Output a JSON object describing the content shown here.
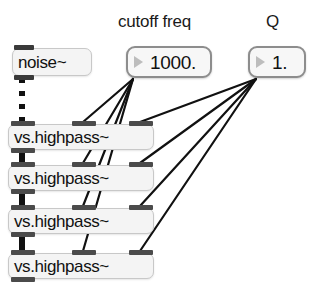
{
  "patch": {
    "title": "highpass filter cascade patch",
    "background_color": "#ffffff",
    "comments": [
      {
        "name": "cutoff-freq-label",
        "text": "cutoff freq",
        "x": 118,
        "y": 12
      },
      {
        "name": "q-label",
        "text": "Q",
        "x": 266,
        "y": 12
      }
    ],
    "objects": [
      {
        "name": "noise-object",
        "text": "noise~",
        "x": 12,
        "y": 48,
        "w": 80,
        "h": 28,
        "inlets": 1,
        "outlets": 1
      },
      {
        "name": "highpass-object-1",
        "text": "vs.highpass~",
        "x": 8,
        "y": 124,
        "w": 146,
        "h": 26,
        "inlets": 3,
        "outlets": 1
      },
      {
        "name": "highpass-object-2",
        "text": "vs.highpass~",
        "x": 8,
        "y": 165,
        "w": 146,
        "h": 26,
        "inlets": 3,
        "outlets": 1
      },
      {
        "name": "highpass-object-3",
        "text": "vs.highpass~",
        "x": 8,
        "y": 208,
        "w": 146,
        "h": 26,
        "inlets": 3,
        "outlets": 1
      },
      {
        "name": "highpass-object-4",
        "text": "vs.highpass~",
        "x": 8,
        "y": 253,
        "w": 146,
        "h": 26,
        "inlets": 3,
        "outlets": 1
      }
    ],
    "number_boxes": [
      {
        "name": "cutoff-freq-number-box",
        "value": "1000.",
        "x": 126,
        "y": 46,
        "w": 86,
        "h": 32
      },
      {
        "name": "q-number-box",
        "value": "1.",
        "x": 248,
        "y": 46,
        "w": 58,
        "h": 32
      }
    ],
    "signal_connections": [
      {
        "name": "signal-cable-noise-to-hp1",
        "x1": 22,
        "y1": 78,
        "x2": 22,
        "y2": 122,
        "style": "dotted"
      },
      {
        "name": "signal-cable-hp1-to-hp2",
        "x1": 22,
        "y1": 150,
        "x2": 22,
        "y2": 163,
        "style": "solid"
      },
      {
        "name": "signal-cable-hp2-to-hp3",
        "x1": 22,
        "y1": 191,
        "x2": 22,
        "y2": 206,
        "style": "solid"
      },
      {
        "name": "signal-cable-hp3-to-hp4",
        "x1": 22,
        "y1": 234,
        "x2": 22,
        "y2": 251,
        "style": "solid"
      }
    ],
    "control_connections": [
      {
        "name": "cable-cutoff-to-hp1-mid",
        "from": "cutoff-freq-number-box",
        "to": "highpass-object-1",
        "x1": 133,
        "y1": 79,
        "x2": 83,
        "y2": 122
      },
      {
        "name": "cable-cutoff-to-hp2-mid",
        "from": "cutoff-freq-number-box",
        "to": "highpass-object-2",
        "x1": 133,
        "y1": 79,
        "x2": 83,
        "y2": 163
      },
      {
        "name": "cable-cutoff-to-hp3-mid",
        "from": "cutoff-freq-number-box",
        "to": "highpass-object-3",
        "x1": 133,
        "y1": 79,
        "x2": 83,
        "y2": 206
      },
      {
        "name": "cable-cutoff-to-hp4-mid",
        "from": "cutoff-freq-number-box",
        "to": "highpass-object-4",
        "x1": 133,
        "y1": 79,
        "x2": 83,
        "y2": 251
      },
      {
        "name": "cable-q-to-hp1-right",
        "from": "q-number-box",
        "to": "highpass-object-1",
        "x1": 256,
        "y1": 79,
        "x2": 140,
        "y2": 122
      },
      {
        "name": "cable-q-to-hp2-right",
        "from": "q-number-box",
        "to": "highpass-object-2",
        "x1": 256,
        "y1": 79,
        "x2": 140,
        "y2": 163
      },
      {
        "name": "cable-q-to-hp3-right",
        "from": "q-number-box",
        "to": "highpass-object-3",
        "x1": 256,
        "y1": 79,
        "x2": 140,
        "y2": 206
      },
      {
        "name": "cable-q-to-hp4-right",
        "from": "q-number-box",
        "to": "highpass-object-4",
        "x1": 256,
        "y1": 79,
        "x2": 140,
        "y2": 251
      }
    ],
    "colors": {
      "object_fill": "#f4f4f4",
      "object_border": "#c8c8c8",
      "numbox_border": "#8d8d8d",
      "iolet": "#4b4b4b",
      "cable": "#111111",
      "text": "#111111"
    }
  }
}
